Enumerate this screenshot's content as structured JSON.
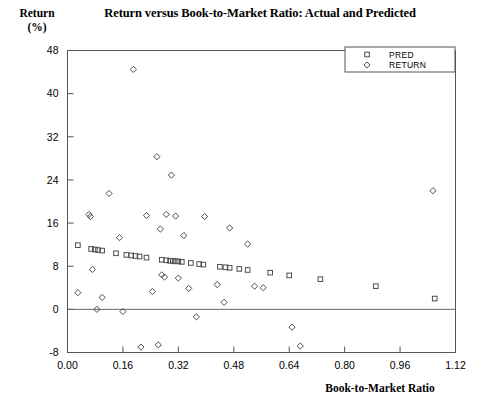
{
  "chart_data": {
    "type": "scatter",
    "title": "Return versus Book-to-Market Ratio: Actual and Predicted",
    "xlabel": "Book-to-Market Ratio",
    "ylabel": "Return (%)",
    "ylabel_lines": [
      "Return",
      "(%)"
    ],
    "xlim": [
      0.0,
      1.12
    ],
    "ylim": [
      -8,
      48
    ],
    "xticks": [
      "0.00",
      "0.16",
      "0.32",
      "0.48",
      "0.64",
      "0.80",
      "0.96",
      "1.12"
    ],
    "xtick_values": [
      0.0,
      0.16,
      0.32,
      0.48,
      0.64,
      0.8,
      0.96,
      1.12
    ],
    "yticks": [
      "48",
      "40",
      "32",
      "24",
      "16",
      "8",
      "0",
      "-8"
    ],
    "ytick_values": [
      48,
      40,
      32,
      24,
      16,
      8,
      0,
      -8
    ],
    "grid": false,
    "zero_line": true,
    "legend_position": "top-right",
    "marker_color": "#4d4d4d",
    "axis_color": "#555555",
    "series": [
      {
        "name": "PRED",
        "marker": "square",
        "points": [
          [
            0.03,
            11.9
          ],
          [
            0.068,
            11.2
          ],
          [
            0.079,
            11.1
          ],
          [
            0.088,
            11.0
          ],
          [
            0.1,
            10.9
          ],
          [
            0.14,
            10.4
          ],
          [
            0.17,
            10.1
          ],
          [
            0.184,
            10.0
          ],
          [
            0.196,
            9.9
          ],
          [
            0.208,
            9.8
          ],
          [
            0.228,
            9.6
          ],
          [
            0.272,
            9.2
          ],
          [
            0.285,
            9.1
          ],
          [
            0.296,
            9.0
          ],
          [
            0.304,
            9.0
          ],
          [
            0.312,
            8.9
          ],
          [
            0.32,
            8.9
          ],
          [
            0.33,
            8.8
          ],
          [
            0.356,
            8.6
          ],
          [
            0.38,
            8.4
          ],
          [
            0.392,
            8.3
          ],
          [
            0.44,
            7.9
          ],
          [
            0.456,
            7.8
          ],
          [
            0.468,
            7.7
          ],
          [
            0.496,
            7.5
          ],
          [
            0.52,
            7.3
          ],
          [
            0.585,
            6.8
          ],
          [
            0.64,
            6.3
          ],
          [
            0.73,
            5.6
          ],
          [
            0.89,
            4.3
          ],
          [
            1.06,
            2.0
          ]
        ]
      },
      {
        "name": "RETURN",
        "marker": "diamond",
        "points": [
          [
            0.03,
            3.1
          ],
          [
            0.062,
            17.6
          ],
          [
            0.066,
            17.2
          ],
          [
            0.072,
            7.4
          ],
          [
            0.085,
            0.0
          ],
          [
            0.1,
            2.2
          ],
          [
            0.12,
            21.5
          ],
          [
            0.15,
            13.3
          ],
          [
            0.16,
            -0.4
          ],
          [
            0.19,
            44.5
          ],
          [
            0.212,
            -7.0
          ],
          [
            0.228,
            17.4
          ],
          [
            0.245,
            3.3
          ],
          [
            0.258,
            28.3
          ],
          [
            0.262,
            -6.6
          ],
          [
            0.268,
            14.9
          ],
          [
            0.272,
            6.4
          ],
          [
            0.28,
            6.0
          ],
          [
            0.285,
            17.6
          ],
          [
            0.3,
            24.9
          ],
          [
            0.312,
            17.3
          ],
          [
            0.32,
            5.8
          ],
          [
            0.336,
            13.7
          ],
          [
            0.35,
            3.9
          ],
          [
            0.372,
            -1.4
          ],
          [
            0.396,
            17.2
          ],
          [
            0.432,
            4.6
          ],
          [
            0.452,
            1.3
          ],
          [
            0.468,
            15.1
          ],
          [
            0.52,
            12.1
          ],
          [
            0.54,
            4.3
          ],
          [
            0.565,
            4.0
          ],
          [
            0.648,
            -3.3
          ],
          [
            0.672,
            -6.8
          ],
          [
            1.055,
            22.0
          ]
        ]
      }
    ]
  },
  "legend": {
    "items": [
      {
        "label": "PRED",
        "marker": "square"
      },
      {
        "label": "RETURN",
        "marker": "diamond"
      }
    ]
  }
}
